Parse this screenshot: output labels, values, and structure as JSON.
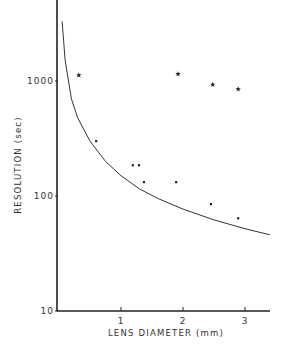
{
  "chart_data": {
    "type": "scatter",
    "title": "",
    "xlabel": "LENS DIAMETER (mm)",
    "ylabel": "RESOLUTION (sec)",
    "xlim": [
      0,
      3.4
    ],
    "ylim": [
      10,
      5000
    ],
    "yscale": "log",
    "x_ticks": [
      "1",
      "2",
      "3"
    ],
    "y_ticks": [
      "10",
      "100",
      "1000"
    ],
    "grid": false,
    "series": [
      {
        "name": "stars",
        "marker": "star",
        "x": [
          0.32,
          1.92,
          2.48,
          2.89
        ],
        "y": [
          1120,
          1150,
          930,
          850
        ]
      },
      {
        "name": "dots",
        "marker": "dot",
        "x": [
          0.6,
          1.19,
          1.29,
          1.37,
          1.89,
          2.45,
          2.89
        ],
        "y": [
          300,
          185,
          185,
          132,
          132,
          85,
          64
        ]
      },
      {
        "name": "curve",
        "marker": "line",
        "x": [
          0.05,
          0.1,
          0.2,
          0.3,
          0.5,
          0.75,
          1.0,
          1.3,
          1.6,
          2.0,
          2.5,
          3.0,
          3.4
        ],
        "y": [
          3300,
          1500,
          700,
          480,
          300,
          200,
          150,
          115,
          95,
          77,
          62,
          52,
          46
        ]
      }
    ]
  }
}
